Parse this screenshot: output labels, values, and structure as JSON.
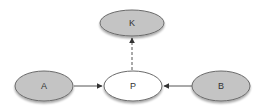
{
  "diagram": {
    "type": "directed-graph",
    "nodes": {
      "k": {
        "label": "K",
        "fill": "#c4c4c4",
        "stroke": "#6a6a6a"
      },
      "a": {
        "label": "A",
        "fill": "#c4c4c4",
        "stroke": "#6a6a6a"
      },
      "p": {
        "label": "P",
        "fill": "#ffffff",
        "stroke": "#6a6a6a"
      },
      "b": {
        "label": "B",
        "fill": "#c4c4c4",
        "stroke": "#6a6a6a"
      }
    },
    "edges": [
      {
        "from": "A",
        "to": "P",
        "style": "solid"
      },
      {
        "from": "B",
        "to": "P",
        "style": "solid"
      },
      {
        "from": "P",
        "to": "K",
        "style": "dashed"
      }
    ]
  }
}
